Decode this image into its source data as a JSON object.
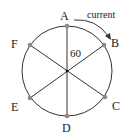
{
  "diagram": {
    "type": "circle-with-diameters",
    "colors": {
      "line": "#333333",
      "point": "#8a8a8a",
      "center": "#111111",
      "text": "#222222",
      "background": "#ffffff"
    },
    "points": [
      {
        "id": "A",
        "label": "A"
      },
      {
        "id": "B",
        "label": "B"
      },
      {
        "id": "C",
        "label": "C"
      },
      {
        "id": "D",
        "label": "D"
      },
      {
        "id": "E",
        "label": "E"
      },
      {
        "id": "F",
        "label": "F"
      }
    ],
    "angle_label": "60",
    "arrow_label": "current"
  }
}
